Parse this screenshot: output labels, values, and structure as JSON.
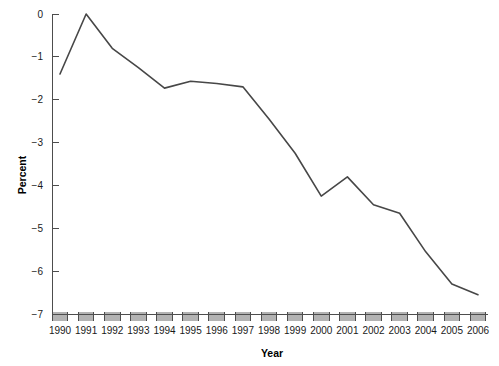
{
  "chart_data": {
    "type": "line",
    "title": "",
    "xlabel": "Year",
    "ylabel": "Percent",
    "categories": [
      1990,
      1991,
      1992,
      1993,
      1994,
      1995,
      1996,
      1997,
      1998,
      1999,
      2000,
      2001,
      2002,
      2003,
      2004,
      2005,
      2006
    ],
    "x_tick_labels": [
      "1990",
      "1991",
      "1992",
      "1993",
      "1994",
      "1995",
      "1996",
      "1997",
      "1998",
      "1999",
      "2000",
      "2001",
      "2002",
      "2003",
      "2004",
      "2005",
      "2006"
    ],
    "values": [
      -1.4,
      0.0,
      -0.8,
      -1.25,
      -1.73,
      -1.57,
      -1.62,
      -1.7,
      -2.45,
      -3.25,
      -4.25,
      -3.8,
      -4.45,
      -4.65,
      -5.55,
      -6.3,
      -6.55
    ],
    "series": [
      {
        "name": "Percent",
        "values": [
          -1.4,
          0.0,
          -0.8,
          -1.25,
          -1.73,
          -1.57,
          -1.62,
          -1.7,
          -2.45,
          -3.25,
          -4.25,
          -3.8,
          -4.45,
          -4.65,
          -5.55,
          -6.3,
          -6.55
        ],
        "color": "#474747"
      }
    ],
    "ylim": [
      -7,
      0
    ],
    "xlim": [
      1990,
      2006
    ],
    "y_ticks": [
      0,
      -1,
      -2,
      -3,
      -4,
      -5,
      -6,
      -7
    ],
    "y_tick_labels": [
      "0",
      "−1",
      "−2",
      "−3",
      "−4",
      "−5",
      "−6",
      "−7"
    ],
    "grid": false,
    "legend": "none",
    "line_color": "#474747",
    "axis_color": "#4d4d4d",
    "x_block_color": "#b3b3b3"
  }
}
